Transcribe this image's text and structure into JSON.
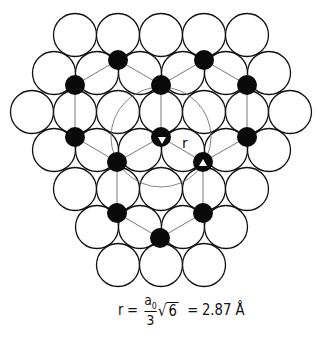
{
  "figure": {
    "colors": {
      "atom_stroke": "#111111",
      "atom_fill": "#ffffff",
      "site_fill": "#0a0a0a",
      "bond": "#555555",
      "ring": "#666666"
    },
    "atom_radius": 21.5,
    "atoms": [
      [
        75,
        35
      ],
      [
        118,
        35
      ],
      [
        161,
        35
      ],
      [
        204,
        35
      ],
      [
        247,
        35
      ],
      [
        54,
        73
      ],
      [
        97,
        73
      ],
      [
        140,
        73
      ],
      [
        183,
        73
      ],
      [
        226,
        73
      ],
      [
        269,
        73
      ],
      [
        32,
        112
      ],
      [
        75,
        112
      ],
      [
        118,
        112
      ],
      [
        161,
        112
      ],
      [
        204,
        112
      ],
      [
        247,
        112
      ],
      [
        290,
        112
      ],
      [
        54,
        150
      ],
      [
        97,
        150
      ],
      [
        140,
        150
      ],
      [
        183,
        150
      ],
      [
        226,
        150
      ],
      [
        269,
        150
      ],
      [
        75,
        189
      ],
      [
        118,
        189
      ],
      [
        161,
        189
      ],
      [
        204,
        189
      ],
      [
        247,
        189
      ],
      [
        97,
        227
      ],
      [
        140,
        227
      ],
      [
        183,
        227
      ],
      [
        226,
        227
      ],
      [
        118,
        265
      ],
      [
        161,
        265
      ],
      [
        204,
        265
      ]
    ],
    "site_radius": 10,
    "sites": [
      {
        "id": "s1",
        "x": 118,
        "y": 60
      },
      {
        "id": "s2",
        "x": 204,
        "y": 60
      },
      {
        "id": "s3",
        "x": 75,
        "y": 85
      },
      {
        "id": "s4",
        "x": 161,
        "y": 85
      },
      {
        "id": "s5",
        "x": 247,
        "y": 85
      },
      {
        "id": "s6",
        "x": 75,
        "y": 137
      },
      {
        "id": "s7",
        "x": 161,
        "y": 137,
        "marker": "triangle-down"
      },
      {
        "id": "s8",
        "x": 247,
        "y": 137
      },
      {
        "id": "s9",
        "x": 117,
        "y": 162
      },
      {
        "id": "s10",
        "x": 203,
        "y": 162,
        "marker": "triangle-up"
      },
      {
        "id": "s11",
        "x": 117,
        "y": 213
      },
      {
        "id": "s12",
        "x": 203,
        "y": 213
      },
      {
        "id": "s13",
        "x": 160,
        "y": 238
      }
    ],
    "bonds": [
      [
        "s1",
        "s3"
      ],
      [
        "s1",
        "s4"
      ],
      [
        "s2",
        "s4"
      ],
      [
        "s2",
        "s5"
      ],
      [
        "s3",
        "s6"
      ],
      [
        "s4",
        "s7"
      ],
      [
        "s5",
        "s8"
      ],
      [
        "s6",
        "s9"
      ],
      [
        "s7",
        "s9"
      ],
      [
        "s7",
        "s10"
      ],
      [
        "s8",
        "s10"
      ],
      [
        "s9",
        "s11"
      ],
      [
        "s10",
        "s12"
      ],
      [
        "s11",
        "s13"
      ],
      [
        "s12",
        "s13"
      ]
    ],
    "ring": {
      "cx": 161,
      "cy": 137,
      "r": 50
    },
    "distance_label": {
      "text": "r",
      "x": 182,
      "y": 148
    }
  },
  "formula": {
    "lhs": "r",
    "equals": "=",
    "numerator": "a",
    "numerator_sub": "0",
    "denominator": "3",
    "radical": "√",
    "radicand": "6",
    "equals2": "=",
    "value": "2.87 Å"
  }
}
